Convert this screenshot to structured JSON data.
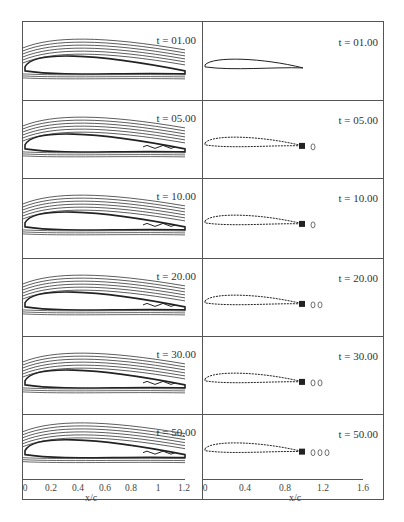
{
  "figure": {
    "left_column": {
      "description": "streamline contours around airfoil",
      "panels": [
        {
          "label": "t = 01.00"
        },
        {
          "label": "t = 05.00"
        },
        {
          "label": "t = 10.00"
        },
        {
          "label": "t = 20.00"
        },
        {
          "label": "t = 30.00"
        },
        {
          "label": "t = 50.00"
        }
      ],
      "x_axis": {
        "label": "x/c",
        "ticks": [
          "0",
          "0.2",
          "0.4",
          "0.6",
          "0.8",
          "1",
          "1.2"
        ]
      }
    },
    "right_column": {
      "description": "vorticity contours around airfoil with wake vortices",
      "panels": [
        {
          "label": "t = 01.00"
        },
        {
          "label": "t = 05.00"
        },
        {
          "label": "t = 10.00"
        },
        {
          "label": "t = 20.00"
        },
        {
          "label": "t = 30.00"
        },
        {
          "label": "t = 50.00"
        }
      ],
      "x_axis": {
        "label": "x/c",
        "ticks": [
          "0",
          "0.4",
          "0.8",
          "1.2",
          "1.6"
        ]
      }
    }
  }
}
